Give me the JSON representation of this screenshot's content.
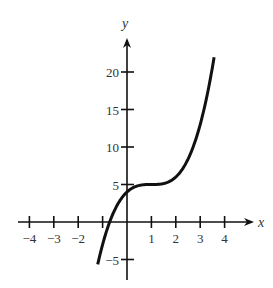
{
  "chart_data": {
    "type": "line",
    "title": "",
    "xlabel": "x",
    "ylabel": "y",
    "xlim": [
      -4.4,
      5
    ],
    "ylim": [
      -7.5,
      24
    ],
    "grid": false,
    "legend": null,
    "x_ticks": [
      -4,
      -3,
      -2,
      -1,
      1,
      2,
      3,
      4
    ],
    "x_tick_labels": [
      "−4",
      "−3",
      "−2",
      "",
      "1",
      "2",
      "3",
      "4"
    ],
    "y_ticks": [
      -5,
      5,
      10,
      15,
      20
    ],
    "y_tick_labels": [
      "−5",
      "5",
      "10",
      "15",
      "20"
    ],
    "series": [
      {
        "name": "f(x)",
        "description": "cubic curve approximately y = (x - 1)^3 + 5",
        "x": [
          -1.2,
          -1.0,
          -0.5,
          0,
          0.5,
          1.0,
          1.5,
          2.0,
          2.5,
          3.0,
          3.3,
          3.57
        ],
        "y": [
          -5.6,
          -3.0,
          1.6,
          4.0,
          4.9,
          5.0,
          5.1,
          6.0,
          8.4,
          13.0,
          17.2,
          22.0
        ]
      }
    ]
  }
}
